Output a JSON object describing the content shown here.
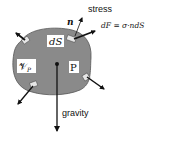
{
  "diagram": {
    "body_label": "P",
    "volume_label": "𝒱",
    "volume_sub": "P",
    "surface_element_label": "dS",
    "normal_label": "n",
    "stress_label": "stress",
    "force_equation": {
      "lhs": "dF",
      "eq": " = ",
      "rhs": "σ·ndS"
    },
    "gravity_label": "gravity",
    "colors": {
      "body_fill": "#8a8a8a",
      "body_stroke": "#555555",
      "arrow": "#111111",
      "patch_fill": "#e6e6e6",
      "label_bg": "#ffffff"
    }
  }
}
